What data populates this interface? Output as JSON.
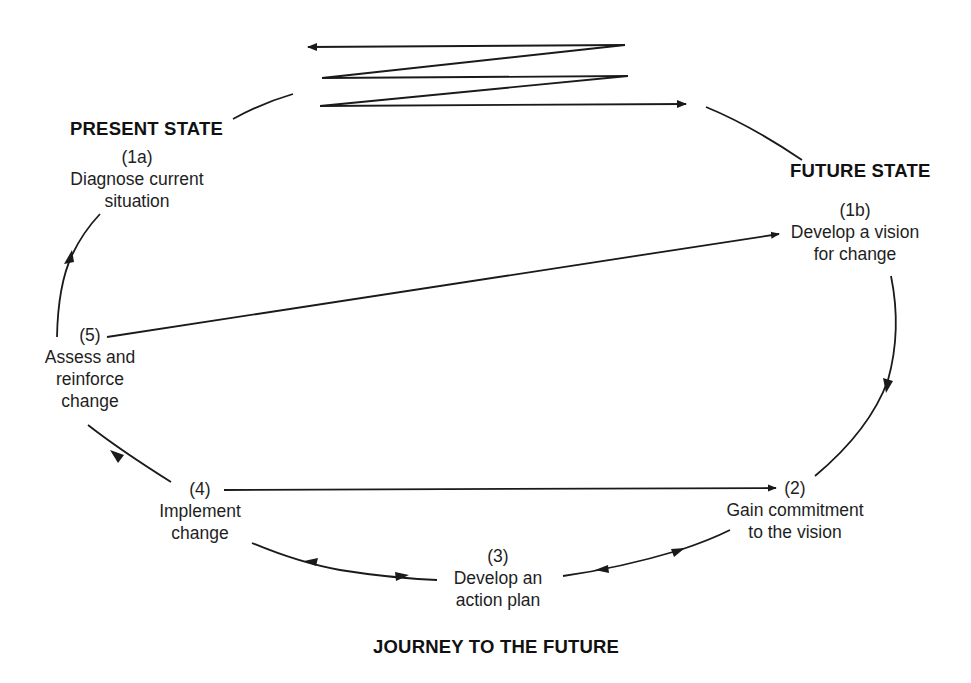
{
  "states": {
    "present": "PRESENT STATE",
    "future": "FUTURE STATE",
    "journey": "JOURNEY TO THE FUTURE"
  },
  "steps": [
    {
      "id": "1a",
      "number": "(1a)",
      "lines": [
        "Diagnose current",
        "situation"
      ]
    },
    {
      "id": "1b",
      "number": "(1b)",
      "lines": [
        "Develop a vision",
        "for change"
      ]
    },
    {
      "id": "2",
      "number": "(2)",
      "lines": [
        "Gain commitment",
        "to the vision"
      ]
    },
    {
      "id": "3",
      "number": "(3)",
      "lines": [
        "Develop an",
        "action plan"
      ]
    },
    {
      "id": "4",
      "number": "(4)",
      "lines": [
        "Implement",
        "change"
      ]
    },
    {
      "id": "5",
      "number": "(5)",
      "lines": [
        "Assess and",
        "reinforce",
        "change"
      ]
    }
  ],
  "colors": {
    "line": "#1a1a1a",
    "background": "#ffffff"
  }
}
